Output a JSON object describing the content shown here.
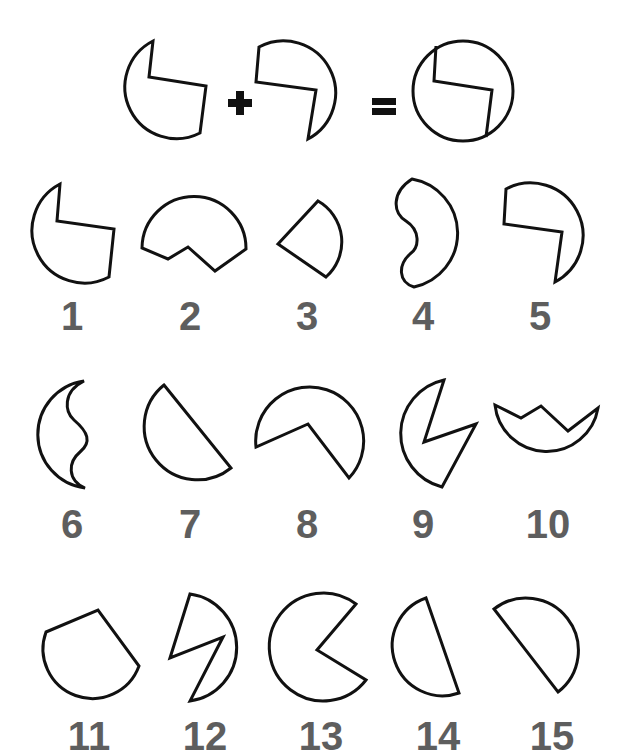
{
  "puzzle": {
    "equation": {
      "left_piece": "piece-a",
      "operator_plus": "+",
      "right_piece": "piece-b",
      "operator_equals": "=",
      "result": "full-circle"
    },
    "label_color": "#5e5e5e",
    "stroke_color": "#111111",
    "options": [
      {
        "id": 1,
        "label": "1"
      },
      {
        "id": 2,
        "label": "2"
      },
      {
        "id": 3,
        "label": "3"
      },
      {
        "id": 4,
        "label": "4"
      },
      {
        "id": 5,
        "label": "5"
      },
      {
        "id": 6,
        "label": "6"
      },
      {
        "id": 7,
        "label": "7"
      },
      {
        "id": 8,
        "label": "8"
      },
      {
        "id": 9,
        "label": "9"
      },
      {
        "id": 10,
        "label": "10"
      },
      {
        "id": 11,
        "label": "11"
      },
      {
        "id": 12,
        "label": "12"
      },
      {
        "id": 13,
        "label": "13"
      },
      {
        "id": 14,
        "label": "14"
      },
      {
        "id": 15,
        "label": "15"
      }
    ]
  }
}
